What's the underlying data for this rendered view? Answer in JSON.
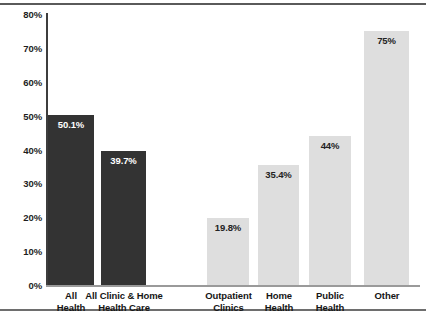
{
  "chart_data": {
    "type": "bar",
    "title": "",
    "subtitle": "",
    "xlabel": "",
    "ylabel": "",
    "ylim": [
      0,
      80
    ],
    "grid": false,
    "legend": null,
    "categories": [
      "All Health",
      "All Clinic & Home Health Care",
      "Outpatient Clinics",
      "Home Health",
      "Public Health",
      "Other"
    ],
    "values": [
      50.1,
      39.7,
      19.8,
      35.4,
      44,
      75
    ],
    "data_labels": [
      "50.1%",
      "39.7%",
      "19.8%",
      "35.4%",
      "44%",
      "75%"
    ],
    "y_ticks": [
      0,
      10,
      20,
      30,
      40,
      50,
      60,
      70,
      80
    ],
    "y_tick_labels": [
      "0%",
      "10%",
      "20%",
      "30%",
      "40%",
      "50%",
      "60%",
      "70%",
      "80%"
    ]
  },
  "bars": [
    {
      "id": "all-health",
      "value": 50.1,
      "label": "50.1%",
      "label_color": "on-dark",
      "color": "#333333",
      "x": 48,
      "width": 46,
      "label_lines": [
        "All",
        "Health"
      ],
      "label_x": 40,
      "label_width": 62
    },
    {
      "id": "all-clinic-and-home-health-care",
      "value": 39.7,
      "label": "39.7%",
      "label_color": "on-dark",
      "color": "#333333",
      "x": 101,
      "width": 45,
      "label_lines": [
        "All Clinic & Home",
        "Health Care"
      ],
      "label_x": 82,
      "label_width": 84
    },
    {
      "id": "outpatient-clinics",
      "value": 19.8,
      "label": "19.8%",
      "label_color": "on-light",
      "color": "#dedede",
      "x": 207,
      "width": 42,
      "label_lines": [
        "Outpatient",
        "Clinics"
      ],
      "label_x": 199,
      "label_width": 59
    },
    {
      "id": "home-health",
      "value": 35.4,
      "label": "35.4%",
      "label_color": "on-light",
      "color": "#dedede",
      "x": 258,
      "width": 41,
      "label_lines": [
        "Home",
        "Health"
      ],
      "label_x": 252,
      "label_width": 54
    },
    {
      "id": "public-health",
      "value": 44,
      "label": "44%",
      "label_color": "on-light",
      "color": "#dedede",
      "x": 309,
      "width": 42,
      "label_lines": [
        "Public",
        "Health"
      ],
      "label_x": 303,
      "label_width": 54
    },
    {
      "id": "other",
      "value": 75,
      "label": "75%",
      "label_color": "on-light",
      "color": "#dedede",
      "x": 364,
      "width": 45,
      "label_lines": [
        "Other"
      ],
      "label_x": 358,
      "label_width": 58
    }
  ],
  "colors": {
    "bar_dark": "#333333",
    "bar_light": "#dedede",
    "axis": "#3d3d3d",
    "baseline": "#9a9a9a",
    "rule": "#5a5a5a",
    "text": "#161616",
    "background": "#ffffff"
  }
}
